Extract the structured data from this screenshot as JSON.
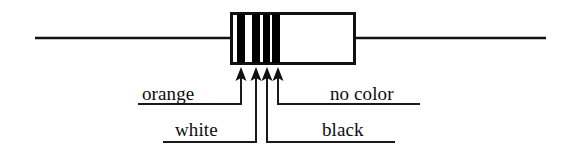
{
  "figure": {
    "background_color": "#ffffff",
    "ink_color": "#111111",
    "width": 574,
    "height": 156
  },
  "component": {
    "type": "resistor",
    "body": {
      "x": 230,
      "y": 12,
      "width": 126,
      "height": 53,
      "fill": "#ffffff",
      "stroke": "#111111"
    },
    "left_lead": {
      "x1": 35,
      "y1": 38,
      "x2": 230,
      "y2": 38
    },
    "right_lead": {
      "x1": 356,
      "y1": 38,
      "x2": 546,
      "y2": 38
    }
  },
  "bands": [
    {
      "id": "band-1",
      "label": "orange",
      "x": 237,
      "width": 8,
      "swatch": "#000000"
    },
    {
      "id": "band-2",
      "label": "white",
      "x": 252,
      "width": 8,
      "swatch": "#000000"
    },
    {
      "id": "band-3",
      "label": "black",
      "x": 263,
      "width": 7,
      "swatch": "#000000"
    },
    {
      "id": "band-4",
      "label": "no color",
      "x": 272,
      "width": 8,
      "swatch": "#000000"
    }
  ],
  "labels": {
    "orange": "orange",
    "white": "white",
    "black": "black",
    "no_color": "no color"
  },
  "leaders": [
    {
      "id": "leader-orange",
      "label": "orange",
      "arrow_x": 241,
      "arrow_tip_y": 70,
      "elbow_y": 104,
      "underline_x1": 138,
      "underline_x2": 248
    },
    {
      "id": "leader-white",
      "label": "white",
      "arrow_x": 256,
      "arrow_tip_y": 70,
      "elbow_y": 142,
      "underline_x1": 163,
      "underline_x2": 272
    },
    {
      "id": "leader-black",
      "label": "black",
      "arrow_x": 267,
      "arrow_tip_y": 70,
      "elbow_y": 142,
      "underline_x1": 285,
      "underline_x2": 395
    },
    {
      "id": "leader-no-color",
      "label": "no color",
      "arrow_x": 278,
      "arrow_tip_y": 70,
      "elbow_y": 104,
      "underline_x1": 310,
      "underline_x2": 420
    }
  ]
}
